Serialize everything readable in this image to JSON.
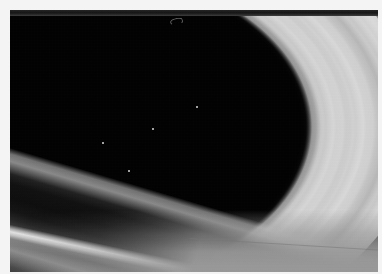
{
  "image": {
    "title": "Saturn's rings",
    "subject": "planetary-ring-system",
    "medium": "grayscale photographic plate",
    "caption": "",
    "frame": {
      "canvas_width": 382,
      "canvas_height": 280,
      "margin_color": "#f4f4f4",
      "photo_left": 10,
      "photo_top": 10,
      "photo_width": 368,
      "photo_height": 262
    },
    "palette": {
      "black": "#000000",
      "deep_shadow": "#0a0a0a",
      "dark_lane": "#1c1c1c",
      "mid_gray": "#7a7a7a",
      "flat_field_gray": "#999999",
      "bright_ring": "#ececec",
      "highlight": "#f4f4f4",
      "page_white": "#ffffff"
    },
    "features": [
      {
        "name": "inner-shadow-ellipse",
        "tone": "black",
        "location": "left-center"
      },
      {
        "name": "bright-b-ring",
        "tone": "bright-gray",
        "location": "center-left"
      },
      {
        "name": "cassini-division",
        "tone": "dark",
        "location": "upper-band"
      },
      {
        "name": "a-ring-band",
        "tone": "mid-gray",
        "location": "right-arc"
      },
      {
        "name": "outer-dark-lane",
        "tone": "near-black",
        "location": "lower-diagonal"
      },
      {
        "name": "bright-edge-streak",
        "tone": "white",
        "location": "lower-left-diagonal"
      },
      {
        "name": "flat-gray-field",
        "tone": "uniform-gray",
        "location": "lower-right-corner"
      }
    ],
    "specks": [
      {
        "x": 118,
        "y": 160
      },
      {
        "x": 92,
        "y": 132
      },
      {
        "x": 186,
        "y": 96
      },
      {
        "x": 142,
        "y": 118
      }
    ]
  }
}
